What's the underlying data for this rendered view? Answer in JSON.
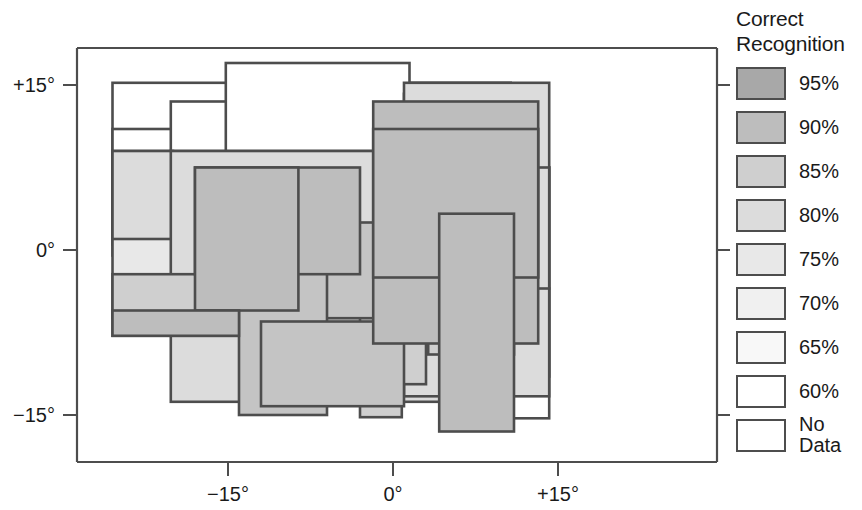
{
  "figure": {
    "type": "receptive-field-map",
    "background": "#ffffff"
  },
  "legend": {
    "title": "Correct\nRecognition",
    "items": [
      {
        "label": "95%",
        "color": "#a8a8a8"
      },
      {
        "label": "90%",
        "color": "#bdbdbd"
      },
      {
        "label": "85%",
        "color": "#cfcfcf"
      },
      {
        "label": "80%",
        "color": "#dcdcdc"
      },
      {
        "label": "75%",
        "color": "#e8e8e8"
      },
      {
        "label": "70%",
        "color": "#f0f0f0"
      },
      {
        "label": "65%",
        "color": "#f8f8f8"
      },
      {
        "label": "60%",
        "color": "#ffffff"
      },
      {
        "label": "No\nData",
        "color": "#ffffff"
      }
    ]
  },
  "chart_data": {
    "type": "heatmap",
    "title": "",
    "xlabel": "",
    "ylabel": "",
    "xlim": [
      -26.2,
      14.5
    ],
    "ylim": [
      -18.0,
      17.0
    ],
    "grid": false,
    "legend_position": "right",
    "xticks": [
      -15,
      0,
      15
    ],
    "xticklabels": [
      "−15°",
      "0°",
      "+15°"
    ],
    "yticks": [
      15,
      0,
      -15
    ],
    "yticklabels": [
      "+15°",
      "0°",
      "−15°"
    ],
    "value_key": "correct_recognition_percent",
    "stroke_color": "#4d4d4d",
    "axis_color": "#4d4d4d",
    "note": "Overlapping rectangular receptive fields; fill gray level encodes correct recognition percentage.",
    "rectangles": [
      {
        "x0": -25.5,
        "x1": 10.7,
        "y0": 0.5,
        "y1": 15.2,
        "value": 60
      },
      {
        "x0": -25.5,
        "x1": 10.7,
        "y0": -0.5,
        "y1": 11.0,
        "value": 60
      },
      {
        "x0": -20.2,
        "x1": 3.0,
        "y0": 1.0,
        "y1": 13.5,
        "value": 60
      },
      {
        "x0": -15.2,
        "x1": 1.5,
        "y0": 2.0,
        "y1": 17.0,
        "value": 60
      },
      {
        "x0": -25.5,
        "x1": -20.0,
        "y0": -6.2,
        "y1": 9.0,
        "value": 75
      },
      {
        "x0": -25.5,
        "x1": 6.5,
        "y0": 1.0,
        "y1": 9.0,
        "value": 80
      },
      {
        "x0": -20.2,
        "x1": 6.5,
        "y0": -13.8,
        "y1": 9.0,
        "value": 80
      },
      {
        "x0": -18.0,
        "x1": -3.0,
        "y0": -2.2,
        "y1": 7.5,
        "value": 90
      },
      {
        "x0": -18.0,
        "x1": -8.6,
        "y0": -5.5,
        "y1": 7.5,
        "value": 90
      },
      {
        "x0": -14.0,
        "x1": -1.0,
        "y0": -6.2,
        "y1": 2.5,
        "value": 88
      },
      {
        "x0": -14.0,
        "x1": -6.0,
        "y0": -15.0,
        "y1": 2.5,
        "value": 88
      },
      {
        "x0": -25.5,
        "x1": -14.0,
        "y0": -7.8,
        "y1": -5.5,
        "value": 90
      },
      {
        "x0": -25.5,
        "x1": -10.5,
        "y0": -7.8,
        "y1": -2.2,
        "value": 85
      },
      {
        "x0": -12.0,
        "x1": 1.0,
        "y0": -14.2,
        "y1": -6.5,
        "value": 88
      },
      {
        "x0": -12.0,
        "x1": 3.0,
        "y0": -12.2,
        "y1": -6.5,
        "value": 85
      },
      {
        "x0": -9.6,
        "x1": 0.2,
        "y0": -11.0,
        "y1": 1.0,
        "value": 85
      },
      {
        "x0": -3.0,
        "x1": 0.8,
        "y0": -15.2,
        "y1": 2.3,
        "value": 85
      },
      {
        "x0": -1.8,
        "x1": 13.2,
        "y0": -8.5,
        "y1": 13.5,
        "value": 90
      },
      {
        "x0": -1.8,
        "x1": 13.2,
        "y0": -2.5,
        "y1": 11.0,
        "value": 90
      },
      {
        "x0": 1.0,
        "x1": 8.2,
        "y0": 1.5,
        "y1": 14.2,
        "value": 80
      },
      {
        "x0": 1.0,
        "x1": 14.2,
        "y0": -13.3,
        "y1": 15.2,
        "value": 80
      },
      {
        "x0": 1.0,
        "x1": 14.2,
        "y0": -3.5,
        "y1": 7.5,
        "value": 80
      },
      {
        "x0": 3.2,
        "x1": 11.0,
        "y0": -9.5,
        "y1": 3.3,
        "value": 85
      },
      {
        "x0": 4.2,
        "x1": 11.0,
        "y0": -16.5,
        "y1": 3.3,
        "value": 90
      },
      {
        "x0": 8.2,
        "x1": 14.2,
        "y0": -11.5,
        "y1": 7.5,
        "value": 75
      },
      {
        "x0": 8.2,
        "x1": 14.2,
        "y0": -15.3,
        "y1": -3.5,
        "value": 60
      },
      {
        "x0": 4.2,
        "x1": 11.0,
        "y0": -11.5,
        "y1": -8.0,
        "value": 70
      }
    ]
  }
}
